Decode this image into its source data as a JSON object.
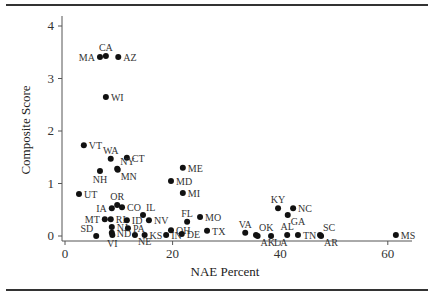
{
  "chart_data": {
    "type": "scatter",
    "title": "",
    "xlabel": "NAE Percent",
    "ylabel": "Composite Score",
    "xlim": [
      -2,
      64
    ],
    "ylim": [
      -0.1,
      4.1
    ],
    "xticks": [
      0,
      20,
      40,
      60
    ],
    "yticks": [
      0,
      1,
      2,
      3,
      4
    ],
    "grid": false,
    "legend": "none",
    "points": [
      {
        "label": "MA",
        "x": 6.5,
        "y": 3.41,
        "pos": "left"
      },
      {
        "label": "CA",
        "x": 7.6,
        "y": 3.43,
        "pos": "top"
      },
      {
        "label": "AZ",
        "x": 9.9,
        "y": 3.41,
        "pos": "right"
      },
      {
        "label": "WI",
        "x": 7.6,
        "y": 2.65,
        "pos": "right"
      },
      {
        "label": "VT",
        "x": 3.5,
        "y": 1.73,
        "pos": "right"
      },
      {
        "label": "WA",
        "x": 8.5,
        "y": 1.47,
        "pos": "top"
      },
      {
        "label": "CT",
        "x": 11.5,
        "y": 1.49,
        "pos": "right"
      },
      {
        "label": "NY",
        "x": 9.7,
        "y": 1.28,
        "pos": "topright"
      },
      {
        "label": "MN",
        "x": 9.8,
        "y": 1.26,
        "pos": "bottomright"
      },
      {
        "label": "NH",
        "x": 6.5,
        "y": 1.24,
        "pos": "below"
      },
      {
        "label": "UT",
        "x": 2.6,
        "y": 0.8,
        "pos": "right"
      },
      {
        "label": "OR",
        "x": 9.7,
        "y": 0.59,
        "pos": "top"
      },
      {
        "label": "IA",
        "x": 8.7,
        "y": 0.53,
        "pos": "left"
      },
      {
        "label": "CO",
        "x": 10.6,
        "y": 0.55,
        "pos": "right"
      },
      {
        "label": "MT",
        "x": 7.4,
        "y": 0.32,
        "pos": "left"
      },
      {
        "label": "RI",
        "x": 8.5,
        "y": 0.32,
        "pos": "right"
      },
      {
        "label": "ID",
        "x": 11.5,
        "y": 0.3,
        "pos": "right"
      },
      {
        "label": "IL",
        "x": 14.5,
        "y": 0.4,
        "pos": "topright"
      },
      {
        "label": "NV",
        "x": 15.6,
        "y": 0.3,
        "pos": "right"
      },
      {
        "label": "SD",
        "x": 5.8,
        "y": 0.0,
        "pos": "topleft"
      },
      {
        "label": "NJ",
        "x": 8.7,
        "y": 0.17,
        "pos": "right"
      },
      {
        "label": "PA",
        "x": 11.7,
        "y": 0.15,
        "pos": "right"
      },
      {
        "label": "ND",
        "x": 8.7,
        "y": 0.06,
        "pos": "right"
      },
      {
        "label": "VI",
        "x": 8.8,
        "y": 0.02,
        "pos": "below"
      },
      {
        "label": "NE",
        "x": 13.0,
        "y": 0.02,
        "pos": "bottomright"
      },
      {
        "label": "KS",
        "x": 14.8,
        "y": 0.02,
        "pos": "right"
      },
      {
        "label": "IN",
        "x": 18.8,
        "y": 0.02,
        "pos": "right"
      },
      {
        "label": "OH",
        "x": 19.7,
        "y": 0.11,
        "pos": "right"
      },
      {
        "label": "DE",
        "x": 21.7,
        "y": 0.04,
        "pos": "right"
      },
      {
        "label": "FL",
        "x": 22.7,
        "y": 0.27,
        "pos": "top"
      },
      {
        "label": "MO",
        "x": 25.1,
        "y": 0.36,
        "pos": "right"
      },
      {
        "label": "TX",
        "x": 26.4,
        "y": 0.1,
        "pos": "right"
      },
      {
        "label": "ME",
        "x": 21.9,
        "y": 1.3,
        "pos": "right"
      },
      {
        "label": "MD",
        "x": 19.7,
        "y": 1.05,
        "pos": "right"
      },
      {
        "label": "MI",
        "x": 21.9,
        "y": 0.82,
        "pos": "right"
      },
      {
        "label": "VA",
        "x": 33.5,
        "y": 0.06,
        "pos": "top"
      },
      {
        "label": "OK",
        "x": 35.5,
        "y": 0.02,
        "pos": "topright"
      },
      {
        "label": "AK",
        "x": 35.8,
        "y": 0.0,
        "pos": "bottomright"
      },
      {
        "label": "LA",
        "x": 38.3,
        "y": 0.0,
        "pos": "bottomright"
      },
      {
        "label": "AL",
        "x": 41.3,
        "y": 0.02,
        "pos": "top"
      },
      {
        "label": "TN",
        "x": 43.3,
        "y": 0.02,
        "pos": "right"
      },
      {
        "label": "SC",
        "x": 47.4,
        "y": 0.02,
        "pos": "topright"
      },
      {
        "label": "AR",
        "x": 47.6,
        "y": 0.0,
        "pos": "bottomright"
      },
      {
        "label": "KY",
        "x": 39.6,
        "y": 0.53,
        "pos": "top"
      },
      {
        "label": "NC",
        "x": 42.4,
        "y": 0.53,
        "pos": "right"
      },
      {
        "label": "GA",
        "x": 41.4,
        "y": 0.4,
        "pos": "bottomright"
      },
      {
        "label": "MS",
        "x": 61.5,
        "y": 0.02,
        "pos": "right"
      }
    ]
  }
}
